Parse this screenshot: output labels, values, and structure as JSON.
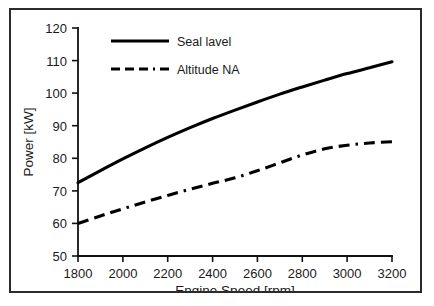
{
  "chart_data": {
    "type": "line",
    "title": "",
    "xlabel": "Engine Speed [rpm]",
    "ylabel": "Power [kW]",
    "xlim": [
      1800,
      3200
    ],
    "ylim": [
      50,
      120
    ],
    "xticks": [
      1800,
      2000,
      2200,
      2400,
      2600,
      2800,
      3000,
      3200
    ],
    "yticks": [
      50,
      60,
      70,
      80,
      90,
      100,
      110,
      120
    ],
    "grid": false,
    "legend_position": "top-center",
    "x": [
      1800,
      1900,
      2000,
      2100,
      2200,
      2300,
      2400,
      2500,
      2600,
      2700,
      2800,
      2900,
      3000,
      3100,
      3200
    ],
    "series": [
      {
        "name": "Seal lavel",
        "style": "solid",
        "values": [
          72.5,
          76.2,
          79.8,
          83.2,
          86.4,
          89.4,
          92.2,
          94.8,
          97.3,
          99.7,
          101.9,
          104.0,
          106.0,
          107.8,
          109.6
        ]
      },
      {
        "name": "Altitude NA",
        "style": "dash-dot",
        "values": [
          60.0,
          62.3,
          64.5,
          66.6,
          68.6,
          70.5,
          72.3,
          74.0,
          76.2,
          78.6,
          81.0,
          82.9,
          84.0,
          84.7,
          85.1
        ]
      }
    ],
    "colors": {
      "series_line": "#000000",
      "axis": "#111111",
      "text": "#1a1a1a",
      "frame": "#2b2b2b",
      "background": "#ffffff"
    }
  },
  "legend": {
    "entries": [
      {
        "label": "Seal lavel"
      },
      {
        "label": "Altitude NA"
      }
    ]
  },
  "xticklabels": {
    "t0": "1800",
    "t1": "2000",
    "t2": "2200",
    "t3": "2400",
    "t4": "2600",
    "t5": "2800",
    "t6": "3000",
    "t7": "3200"
  },
  "yticklabels": {
    "t0": "50",
    "t1": "60",
    "t2": "70",
    "t3": "80",
    "t4": "90",
    "t5": "100",
    "t6": "110",
    "t7": "120"
  },
  "axes": {
    "x_title": "Engine Speed [rpm]",
    "y_title": "Power [kW]"
  }
}
